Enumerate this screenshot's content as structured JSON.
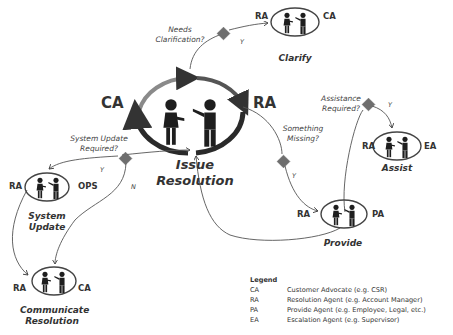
{
  "diagram": {
    "center": {
      "title_line1": "Issue",
      "title_line2": "Resolution",
      "left_role": "CA",
      "right_role": "RA"
    },
    "decisions": [
      {
        "id": "clarification",
        "question_line1": "Needs",
        "question_line2": "Clarification?",
        "yes_label": "Y"
      },
      {
        "id": "system-update",
        "question_line1": "System Update",
        "question_line2": "Required?",
        "yes_label": "Y",
        "no_label": "N"
      },
      {
        "id": "something-missing",
        "question_line1": "Something",
        "question_line2": "Missing?",
        "yes_label": "Y"
      },
      {
        "id": "assistance",
        "question_line1": "Assistance",
        "question_line2": "Required?",
        "yes_label": "Y"
      }
    ],
    "nodes": {
      "clarify": {
        "name": "Clarify",
        "left_role": "RA",
        "right_role": "CA"
      },
      "assist": {
        "name": "Assist",
        "left_role": "RA",
        "right_role": "EA"
      },
      "provide": {
        "name": "Provide",
        "left_role": "RA",
        "right_role": "PA"
      },
      "system_update": {
        "name_line1": "System",
        "name_line2": "Update",
        "left_role": "RA",
        "right_role": "OPS"
      },
      "communicate": {
        "name_line1": "Communicate",
        "name_line2": "Resolution",
        "left_role": "RA",
        "right_role": "CA"
      }
    },
    "colors": {
      "diamond": "#6e6e6e",
      "ring_dark": "#2a2a2a",
      "ring_light": "#8a8a8a",
      "figure": "#1e1e1e",
      "line": "#555555"
    }
  },
  "legend": {
    "title": "Legend",
    "entries": [
      {
        "abbr": "CA",
        "desc": "Customer Advocate (e.g. CSR)"
      },
      {
        "abbr": "RA",
        "desc": "Resolution Agent (e.g. Account Manager)"
      },
      {
        "abbr": "PA",
        "desc": "Provide Agent (e.g. Employee, Legal, etc.)"
      },
      {
        "abbr": "EA",
        "desc": "Escalation Agent (e.g. Supervisor)"
      }
    ]
  }
}
